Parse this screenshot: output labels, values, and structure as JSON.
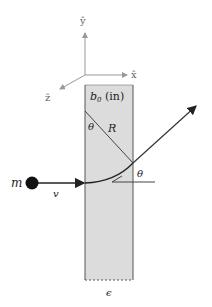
{
  "diagram": {
    "axes": {
      "y_label": "ŷ",
      "x_label": "x̂",
      "z_label": "ẑ"
    },
    "slab": {
      "field_label": "b",
      "field_subscript": "0",
      "field_direction": " (in)",
      "thickness_label": "ϵ",
      "fill_color": "#dcdcdc",
      "edge_color": "#555555"
    },
    "particle": {
      "mass_label": "m",
      "velocity_label": "v",
      "color": "#111111"
    },
    "geometry": {
      "radius_label": "R",
      "angle_label_top": "θ",
      "angle_label_exit": "θ"
    }
  }
}
